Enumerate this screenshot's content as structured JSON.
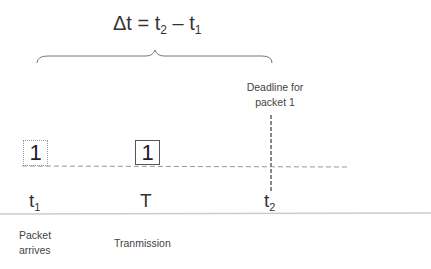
{
  "formula": {
    "prefix": "Δt = t",
    "sub1": "2",
    "mid": " – t",
    "sub2": "1"
  },
  "deadline_label": {
    "line1": "Deadline for",
    "line2": "packet 1"
  },
  "packets": [
    {
      "label": "1",
      "state": "arrived",
      "border": "dotted"
    },
    {
      "label": "1",
      "state": "transmitted",
      "border": "solid"
    }
  ],
  "time_marks": [
    {
      "base": "t",
      "sub": "1"
    },
    {
      "base": "T",
      "sub": ""
    },
    {
      "base": "t",
      "sub": "2"
    }
  ],
  "descriptions": [
    {
      "line1": "Packet",
      "line2": "arrives"
    },
    {
      "line1": "Tranmission",
      "line2": ""
    }
  ],
  "colors": {
    "line": "#999999",
    "deadline": "#888888",
    "brace": "#777777",
    "axis": "#cccccc"
  }
}
